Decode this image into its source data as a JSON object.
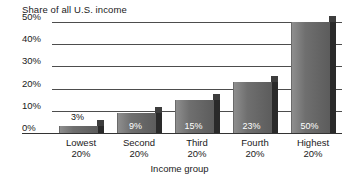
{
  "chart_data": {
    "type": "bar",
    "title": "Share of all U.S. income",
    "xlabel": "Income group",
    "ylabel": "",
    "categories": [
      "Lowest 20%",
      "Second 20%",
      "Third 20%",
      "Fourth 20%",
      "Highest 20%"
    ],
    "category_lines": [
      {
        "line1": "Lowest",
        "line2": "20%"
      },
      {
        "line1": "Second",
        "line2": "20%"
      },
      {
        "line1": "Third",
        "line2": "20%"
      },
      {
        "line1": "Fourth",
        "line2": "20%"
      },
      {
        "line1": "Highest",
        "line2": "20%"
      }
    ],
    "values": [
      3,
      9,
      15,
      23,
      50
    ],
    "value_labels": [
      "3%",
      "9%",
      "15%",
      "23%",
      "50%"
    ],
    "ylim": [
      0,
      50
    ],
    "ytick_labels": [
      "50%",
      "40%",
      "30%",
      "20%",
      "10%",
      "0%"
    ],
    "ytick_values": [
      50,
      40,
      30,
      20,
      10,
      0
    ],
    "grid": true,
    "legend": "none",
    "style": "3d-bar",
    "colors": {
      "bar_front": "#6f6f6f",
      "bar_side": "#2a2a2a",
      "bar_top": "#3d3d3d",
      "gridline": "#4d4d4d",
      "axis": "#333333",
      "text": "#1a1a1a",
      "value_text_inside": "#ffffff",
      "value_text_above": "#111111",
      "background": "#ffffff"
    }
  }
}
